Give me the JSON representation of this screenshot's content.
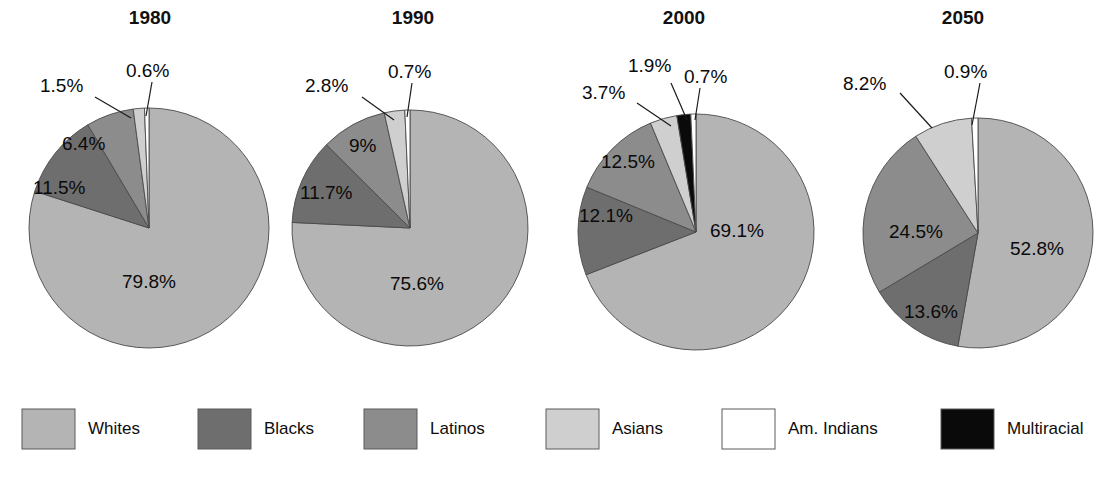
{
  "chart_data": {
    "type": "pie",
    "title": "",
    "subtitle": "",
    "xlabel": "",
    "ylabel": "",
    "legend_position": "bottom",
    "grid": false,
    "unit": "%",
    "categories": [
      "Whites",
      "Blacks",
      "Latinos",
      "Asians",
      "Am. Indians",
      "Multiracial"
    ],
    "colors": {
      "Whites": "#b4b4b4",
      "Blacks": "#6e6e6e",
      "Latinos": "#8c8c8c",
      "Asians": "#cfcfcf",
      "Am. Indians": "#ffffff",
      "Multiracial": "#0a0a0a"
    },
    "panels": [
      {
        "title": "1980",
        "values": [
          79.8,
          11.5,
          6.4,
          1.5,
          0.6,
          0
        ],
        "labels": [
          "79.8%",
          "11.5%",
          "6.4%",
          "1.5%",
          "0.6%",
          ""
        ]
      },
      {
        "title": "1990",
        "values": [
          75.6,
          11.7,
          9,
          2.8,
          0.7,
          0
        ],
        "labels": [
          "75.6%",
          "11.7%",
          "9%",
          "2.8%",
          "0.7%",
          ""
        ]
      },
      {
        "title": "2000",
        "values": [
          69.1,
          12.1,
          12.5,
          3.7,
          0.7,
          1.9
        ],
        "labels": [
          "69.1%",
          "12.1%",
          "12.5%",
          "3.7%",
          "0.7%",
          "1.9%"
        ]
      },
      {
        "title": "2050",
        "values": [
          52.8,
          13.6,
          24.5,
          8.2,
          0.9,
          0
        ],
        "labels": [
          "52.8%",
          "13.6%",
          "24.5%",
          "8.2%",
          "0.9%",
          ""
        ]
      }
    ]
  },
  "panels": {
    "p1980": {
      "year": "1980",
      "whites": "79.8%",
      "blacks": "11.5%",
      "latinos": "6.4%",
      "asians": "1.5%",
      "am_indians": "0.6%"
    },
    "p1990": {
      "year": "1990",
      "whites": "75.6%",
      "blacks": "11.7%",
      "latinos": "9%",
      "asians": "2.8%",
      "am_indians": "0.7%"
    },
    "p2000": {
      "year": "2000",
      "whites": "69.1%",
      "blacks": "12.1%",
      "latinos": "12.5%",
      "asians": "3.7%",
      "multiracial": "1.9%",
      "am_indians": "0.7%"
    },
    "p2050": {
      "year": "2050",
      "whites": "52.8%",
      "blacks": "13.6%",
      "latinos": "24.5%",
      "asians": "8.2%",
      "am_indians": "0.9%"
    }
  },
  "legend": {
    "items": [
      {
        "label": "Whites",
        "color": "#b4b4b4"
      },
      {
        "label": "Blacks",
        "color": "#6e6e6e"
      },
      {
        "label": "Latinos",
        "color": "#8c8c8c"
      },
      {
        "label": "Asians",
        "color": "#cfcfcf"
      },
      {
        "label": "Am. Indians",
        "color": "#ffffff"
      },
      {
        "label": "Multiracial",
        "color": "#0a0a0a"
      }
    ]
  }
}
